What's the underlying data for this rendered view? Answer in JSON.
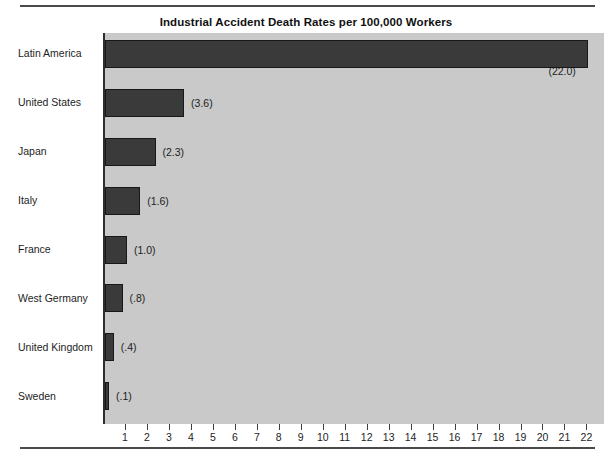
{
  "chart_data": {
    "type": "bar",
    "orientation": "horizontal",
    "title": "Industrial Accident Death Rates per 100,000 Workers",
    "xlabel": "",
    "ylabel": "",
    "categories": [
      "Latin America",
      "United States",
      "Japan",
      "Italy",
      "France",
      "West Germany",
      "United Kingdom",
      "Sweden"
    ],
    "values": [
      22.0,
      3.6,
      2.3,
      1.6,
      1.0,
      0.8,
      0.4,
      0.1
    ],
    "value_labels": [
      "(22.0)",
      "(3.6)",
      "(2.3)",
      "(1.6)",
      "(1.0)",
      "(.8)",
      "(.4)",
      "(.1)"
    ],
    "xlim": [
      0,
      22.8
    ],
    "xticks": [
      1,
      2,
      3,
      4,
      5,
      6,
      7,
      8,
      9,
      10,
      11,
      12,
      13,
      14,
      15,
      16,
      17,
      18,
      19,
      20,
      21,
      22
    ],
    "xtick_labels": [
      "1",
      "2",
      "3",
      "4",
      "5",
      "6",
      "7",
      "8",
      "9",
      "10",
      "11",
      "12",
      "13",
      "14",
      "15",
      "16",
      "17",
      "18",
      "19",
      "20",
      "21",
      "22"
    ],
    "grid": false,
    "legend": false,
    "colors": {
      "bar_fill": "#3a3a3a",
      "bar_border": "#181818",
      "plot_background": "#c9c9c9",
      "page_background": "#ffffff",
      "text": "#1d1d1d",
      "rule": "#4a4a4a"
    }
  }
}
